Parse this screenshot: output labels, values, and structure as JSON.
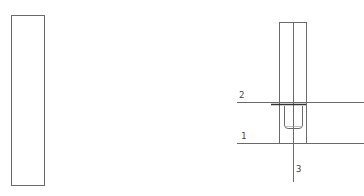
{
  "diagram": {
    "colors": {
      "stroke": "#6a6a6a",
      "thick": "#333333",
      "background": "#ffffff"
    },
    "labels": [
      {
        "id": "line-2",
        "text": "2"
      },
      {
        "id": "line-1",
        "text": "1"
      },
      {
        "id": "axis-3",
        "text": "3"
      }
    ]
  }
}
